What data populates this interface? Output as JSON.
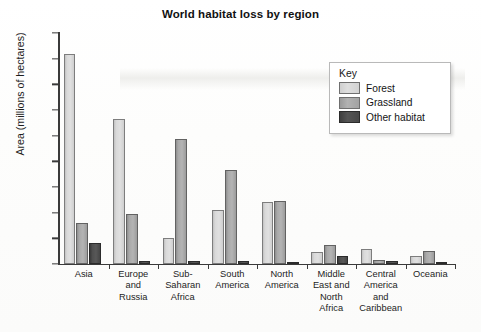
{
  "chart_data": {
    "type": "bar",
    "title": "World habitat loss by region",
    "xlabel": "",
    "ylabel": "Area (millions of hectares)",
    "ylim": [
      0,
      900
    ],
    "ytick_step": 100,
    "yticks": [
      900,
      800,
      700,
      600,
      500,
      400,
      300,
      200,
      100,
      0
    ],
    "grid": false,
    "legend_position": "upper-right",
    "legend_title": "Key",
    "categories": [
      "Asia",
      "Europe and Russia",
      "Sub-Saharan Africa",
      "South America",
      "North America",
      "Middle East and North Africa",
      "Central America and Caribbean",
      "Oceania"
    ],
    "category_display": [
      "Asia",
      "Europe\nand\nRussia",
      "Sub-\nSaharan\nAfrica",
      "South\nAmerica",
      "North\nAmerica",
      "Middle\nEast and\nNorth\nAfrica",
      "Central\nAmerica\nand\nCaribbean",
      "Oceania"
    ],
    "series": [
      {
        "name": "Forest",
        "color": "#d9d9d9",
        "values": [
          820,
          565,
          100,
          210,
          240,
          45,
          60,
          30
        ]
      },
      {
        "name": "Grassland",
        "color": "#a9a9a9",
        "values": [
          160,
          193,
          488,
          367,
          245,
          75,
          15,
          50
        ]
      },
      {
        "name": "Other habitat",
        "color": "#4a4a4a",
        "values": [
          80,
          12,
          10,
          10,
          8,
          33,
          12,
          4
        ]
      }
    ]
  }
}
